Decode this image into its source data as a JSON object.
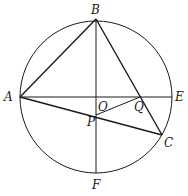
{
  "diagram": {
    "type": "geometry-circle",
    "stroke_color": "#1a1a1a",
    "circle": {
      "center": "O",
      "cx": 96,
      "cy": 97,
      "r": 76
    },
    "points": {
      "A": {
        "x": 20,
        "y": 97,
        "label": "A",
        "lx": 4,
        "ly": 101
      },
      "B": {
        "x": 96,
        "y": 19,
        "label": "B",
        "lx": 91,
        "ly": 14
      },
      "E": {
        "x": 172,
        "y": 97,
        "label": "E",
        "lx": 175,
        "ly": 101
      },
      "F": {
        "x": 96,
        "y": 173,
        "label": "F",
        "lx": 92,
        "ly": 189
      },
      "O": {
        "x": 96,
        "y": 97,
        "label": "O",
        "lx": 98,
        "ly": 111
      },
      "P": {
        "x": 96,
        "y": 115,
        "label": "P",
        "lx": 87,
        "ly": 126
      },
      "Q": {
        "x": 140,
        "y": 97,
        "label": "Q",
        "lx": 134,
        "ly": 111
      },
      "C": {
        "x": 162,
        "y": 135,
        "label": "C",
        "lx": 164,
        "ly": 147
      }
    },
    "segments": [
      [
        "A",
        "B"
      ],
      [
        "B",
        "C"
      ],
      [
        "A",
        "C"
      ],
      [
        "A",
        "E"
      ],
      [
        "B",
        "F"
      ],
      [
        "P",
        "Q"
      ]
    ]
  }
}
